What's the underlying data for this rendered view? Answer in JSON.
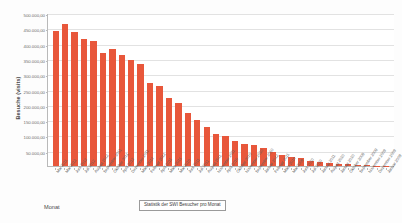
{
  "chart_data": {
    "type": "bar",
    "title": "",
    "legend": "Statistik der SWI Besucher pro Monat",
    "legend_position": "bottom-center",
    "xlabel": "Monat",
    "ylabel": "Besuche (visits)",
    "ylim": [
      0,
      500000
    ],
    "ytick_labels": [
      "500.000,00",
      "450.000,00",
      "400.000,00",
      "350.000,00",
      "300.000,00",
      "250.000,00",
      "200.000,00",
      "150.000,00",
      "100.000,00",
      "50.000,00"
    ],
    "ytick_values": [
      500000,
      450000,
      400000,
      350000,
      300000,
      250000,
      200000,
      150000,
      100000,
      50000
    ],
    "grid": true,
    "bar_color": "#e8573b",
    "categories": [
      "Mai 2011",
      "Mai 2012",
      "Juni 2012",
      "Juli 2012",
      "August 2012",
      "September 2011",
      "Oktober 2011",
      "April 2012",
      "Dezember 2011",
      "März 2012",
      "Februar 2012",
      "April 2011",
      "März 2011",
      "Mai 2010",
      "Juni 2011",
      "Juli 2011",
      "August 2011",
      "November 2011",
      "April 2010",
      "Oktober 2010",
      "November 2010",
      "September 2010",
      "Januar 2012",
      "Februar 2011",
      "März 2010",
      "Mai 2009",
      "Juni 2010",
      "Juli 2010",
      "Januar 2011",
      "August 2010",
      "Januar 2010",
      "Oktober 2009",
      "September 2009",
      "November 2009",
      "Dezember 2009",
      "Januar 2009"
    ],
    "values": [
      440000,
      465000,
      437000,
      415000,
      408000,
      368000,
      383000,
      362000,
      345000,
      332000,
      272000,
      262000,
      223000,
      205000,
      172000,
      152000,
      128000,
      103000,
      97000,
      82000,
      73000,
      68000,
      60000,
      45000,
      35000,
      28000,
      25000,
      18000,
      13000,
      10000,
      8000,
      6000,
      4000,
      2500,
      1500,
      800
    ]
  }
}
